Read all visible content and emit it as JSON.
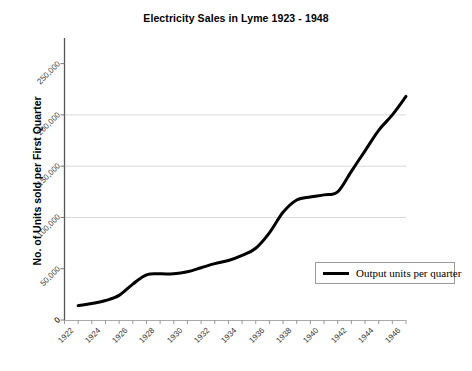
{
  "chart_data": {
    "type": "line",
    "title": "Electricity Sales in Lyme 1923 - 1948",
    "xlabel": "",
    "ylabel": "No. of Units sold per First Quarter",
    "xlim": [
      1922,
      1947
    ],
    "ylim": [
      0,
      275000
    ],
    "grid": "horizontal",
    "legend_position": "lower-right",
    "y_ticks": [
      0,
      50000,
      100000,
      150000,
      200000,
      250000
    ],
    "y_tick_labels": [
      "0",
      "50,000",
      "100,000",
      "150,000",
      "200,000",
      "250,000"
    ],
    "x_tick_labels": [
      "1922",
      "1924",
      "1926",
      "1928",
      "1930",
      "1932",
      "1934",
      "1936",
      "1938",
      "1940",
      "1942",
      "1944",
      "1946"
    ],
    "gridline_values": [
      100000,
      150000,
      200000
    ],
    "series": [
      {
        "name": "Output units per quarter",
        "color": "#000000",
        "x": [
          1923,
          1924,
          1925,
          1926,
          1927,
          1928,
          1929,
          1930,
          1931,
          1932,
          1933,
          1934,
          1935,
          1936,
          1937,
          1938,
          1939,
          1940,
          1941,
          1942,
          1943,
          1944,
          1945,
          1946,
          1947
        ],
        "values": [
          14000,
          16000,
          19000,
          24000,
          35000,
          44000,
          45000,
          45000,
          47000,
          51000,
          55000,
          58000,
          63000,
          70000,
          85000,
          105000,
          117000,
          120000,
          122000,
          125000,
          145000,
          165000,
          185000,
          200000,
          218000
        ]
      }
    ]
  },
  "legend": {
    "entries": [
      {
        "label": "Output units per quarter",
        "color": "#000000"
      }
    ]
  },
  "axes": {
    "y_title": "No. of Units sold per First Quarter",
    "origin_label": "0"
  }
}
